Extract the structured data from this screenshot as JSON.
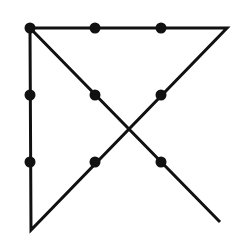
{
  "diagram": {
    "colors": {
      "line": "#111111",
      "dot": "#111111",
      "background": "#ffffff"
    },
    "dots": [
      {
        "x": 30,
        "y": 28
      },
      {
        "x": 95,
        "y": 28
      },
      {
        "x": 161,
        "y": 28
      },
      {
        "x": 30,
        "y": 95
      },
      {
        "x": 95,
        "y": 95
      },
      {
        "x": 161,
        "y": 95
      },
      {
        "x": 30,
        "y": 162
      },
      {
        "x": 95,
        "y": 162
      },
      {
        "x": 161,
        "y": 162
      }
    ],
    "path": [
      {
        "x": 220,
        "y": 222
      },
      {
        "x": 30,
        "y": 28
      },
      {
        "x": 227,
        "y": 28
      },
      {
        "x": 31,
        "y": 230
      },
      {
        "x": 30,
        "y": 28
      }
    ]
  }
}
